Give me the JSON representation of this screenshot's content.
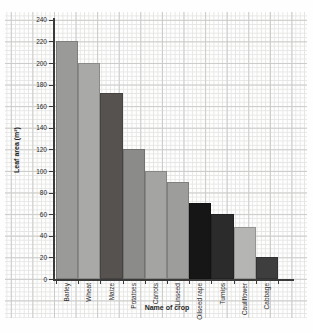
{
  "chart_data": {
    "type": "bar",
    "title": "",
    "xlabel": "Name of crop",
    "ylabel": "Leaf area (m²)",
    "ylim": [
      0,
      240
    ],
    "ytick_step": 20,
    "ytick_labels": [
      "0",
      "20",
      "40",
      "60",
      "80",
      "100",
      "120",
      "140",
      "160",
      "180",
      "200",
      "220",
      "240"
    ],
    "grid": true,
    "grid_style": "graph-paper (minor + major squares)",
    "legend": "none",
    "categories": [
      "Barley",
      "Wheat",
      "Maize",
      "Potatoes",
      "Carrots",
      "Linseed",
      "Oilseed rape",
      "Turnips",
      "Cauliflower",
      "Cabbage"
    ],
    "values": [
      220,
      200,
      172,
      120,
      100,
      90,
      70,
      60,
      48,
      20
    ],
    "bar_colors": [
      "#9a9a98",
      "#a9a9a7",
      "#565250",
      "#8b8b89",
      "#a4a4a2",
      "#9d9d9b",
      "#161616",
      "#2b2b2b",
      "#b5b5b3",
      "#3e3e3e"
    ],
    "axis_color": "#3a3a3a",
    "tick_label_color": "#2e2e2e",
    "minor_grid_color": "#e5e5e3",
    "major_grid_color": "#cbcbc9",
    "background_color": "#fefefe"
  }
}
